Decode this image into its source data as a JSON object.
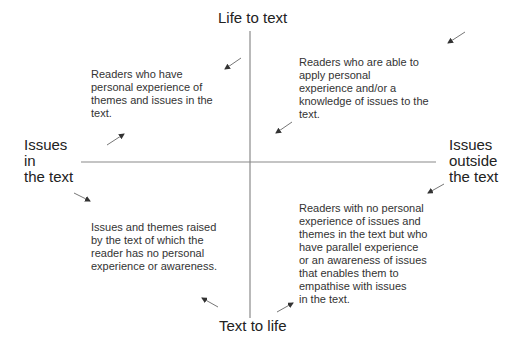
{
  "diagram": {
    "axes": {
      "top": "Life to text",
      "bottom": "Text to life",
      "left": "Issues\nin\nthe text",
      "right": "Issues\noutside\nthe text"
    },
    "quadrants": {
      "top_left": "Readers who have\npersonal experience of\nthemes and issues in the\ntext.",
      "top_right": "Readers who are able to\napply personal\nexperience and/or a\nknowledge of issues to the\ntext.",
      "bottom_left": "Issues and themes raised\nby the text of which the\nreader has no personal\nexperience or awareness.",
      "bottom_right": "Readers with no personal\nexperience of issues and\nthemes in the text but who\nhave parallel experience\nor an awareness of issues\nthat enables them to\nempathise with issues\nin the text."
    },
    "colors": {
      "axis_line": "#8a8a8a",
      "arrow": "#333333",
      "text": "#2b2b2b"
    }
  }
}
